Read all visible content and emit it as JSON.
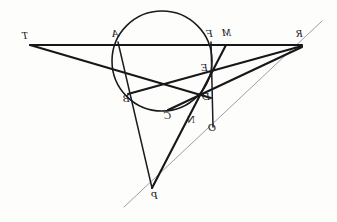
{
  "figure": {
    "width": 337,
    "height": 222,
    "background_color": "#fdfdfc",
    "ink_color": "#17171a",
    "faint_line_color": "#8d8d92",
    "labels_mirrored": true
  },
  "circle": {
    "name": "conic-circle",
    "center_x": 162,
    "center_y": 61,
    "radius": 50
  },
  "points": [
    {
      "id": "T",
      "label": "T",
      "x": 30,
      "y": 45,
      "label_x": 22,
      "label_y": 30,
      "on_circle": false
    },
    {
      "id": "A",
      "label": "A",
      "x": 118,
      "y": 45,
      "label_x": 112,
      "label_y": 28,
      "on_circle": true
    },
    {
      "id": "F",
      "label": "F",
      "x": 211,
      "y": 45,
      "label_x": 206,
      "label_y": 28,
      "on_circle": true
    },
    {
      "id": "M",
      "label": "M",
      "x": 226,
      "y": 45,
      "label_x": 222,
      "label_y": 27,
      "on_circle": false
    },
    {
      "id": "R",
      "label": "R",
      "x": 302,
      "y": 45,
      "label_x": 296,
      "label_y": 28,
      "on_circle": false
    },
    {
      "id": "E",
      "label": "E",
      "x": 211,
      "y": 75,
      "label_x": 201,
      "label_y": 62,
      "on_circle": true
    },
    {
      "id": "B",
      "label": "B",
      "x": 131,
      "y": 93,
      "label_x": 123,
      "label_y": 93,
      "on_circle": true
    },
    {
      "id": "D",
      "label": "D",
      "x": 207,
      "y": 96,
      "label_x": 202,
      "label_y": 91,
      "on_circle": true
    },
    {
      "id": "C",
      "label": "C",
      "x": 172,
      "y": 108,
      "label_x": 164,
      "label_y": 110,
      "on_circle": true
    },
    {
      "id": "N",
      "label": "N",
      "x": 192,
      "y": 118,
      "label_x": 187,
      "label_y": 114,
      "on_circle": false
    },
    {
      "id": "O",
      "label": "O",
      "x": 213,
      "y": 125,
      "label_x": 208,
      "label_y": 122,
      "on_circle": false
    },
    {
      "id": "P",
      "label": "P",
      "x": 152,
      "y": 188,
      "label_x": 151,
      "label_y": 190,
      "on_circle": false
    }
  ],
  "segments": [
    {
      "name": "line-T-to-R",
      "from": "T",
      "to": "R",
      "weight": "thick",
      "x1": 30,
      "y1": 45,
      "x2": 302,
      "y2": 45
    },
    {
      "name": "line-T-to-D",
      "from": "T",
      "to": "D",
      "weight": "thick",
      "x1": 30,
      "y1": 45,
      "x2": 211,
      "y2": 98
    },
    {
      "name": "line-A-to-P",
      "from": "A",
      "to": "P",
      "weight": "med",
      "x1": 118,
      "y1": 42,
      "x2": 152,
      "y2": 188
    },
    {
      "name": "line-F-to-O",
      "from": "F",
      "to": "O",
      "weight": "med",
      "x1": 211,
      "y1": 42,
      "x2": 213,
      "y2": 127
    },
    {
      "name": "line-M-to-P",
      "from": "M",
      "to": "P",
      "weight": "thick",
      "x1": 226,
      "y1": 45,
      "x2": 152,
      "y2": 188
    },
    {
      "name": "line-R-to-B",
      "from": "R",
      "to": "B",
      "weight": "thick",
      "x1": 302,
      "y1": 46,
      "x2": 128,
      "y2": 94
    },
    {
      "name": "line-R-to-C",
      "from": "R",
      "to": "C",
      "weight": "thick",
      "x1": 302,
      "y1": 47,
      "x2": 168,
      "y2": 110
    },
    {
      "name": "pascal-line",
      "from": "P",
      "to": "R",
      "weight": "thin",
      "x1": 124,
      "y1": 207,
      "x2": 322,
      "y2": 21
    }
  ],
  "hexagon_vertices": [
    "A",
    "B",
    "C",
    "D",
    "E",
    "F"
  ]
}
